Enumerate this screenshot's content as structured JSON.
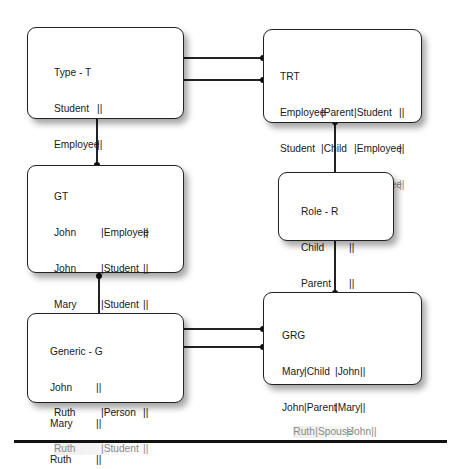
{
  "diagram": {
    "tables": {
      "type_t": {
        "title": "Type - T",
        "rows": [
          {
            "c1": "Student",
            "end": "||"
          },
          {
            "c1": "Employee",
            "end": "||"
          },
          {
            "c1": "Person",
            "end": "||"
          }
        ]
      },
      "trt": {
        "title": "TRT",
        "rows": [
          {
            "c1": "Employee",
            "c2": "|Parent",
            "c3": "|Student",
            "end": "||",
            "faded": false
          },
          {
            "c1": "Student",
            "c2": "|Child",
            "c3": "|Employee",
            "end": "||",
            "faded": false
          },
          {
            "c1": "Student",
            "c2": "|Spouse",
            "c3": "|Employee",
            "end": "||",
            "faded": true
          }
        ]
      },
      "gt": {
        "title": "GT",
        "rows": [
          {
            "c1": "John",
            "c2": "|Employee",
            "end": "||",
            "faded": false
          },
          {
            "c1": "John",
            "c2": "|Student",
            "end": "||",
            "faded": false
          },
          {
            "c1": "Mary",
            "c2": "|Student",
            "end": "||",
            "faded": false
          },
          {
            "c1": "John",
            "c2": "|Person",
            "end": "||",
            "faded": false
          },
          {
            "c1": "Mary",
            "c2": "|Person",
            "end": "||",
            "faded": false
          },
          {
            "c1": "Ruth",
            "c2": "|Person",
            "end": "||",
            "faded": false
          },
          {
            "c1": "Ruth",
            "c2": "|Student",
            "end": "||",
            "faded": true
          }
        ]
      },
      "role_r": {
        "title": "Role - R",
        "rows": [
          {
            "c1": "Child",
            "end": "||",
            "faded": false
          },
          {
            "c1": "Parent",
            "end": "||",
            "faded": false
          },
          {
            "c1": "Spouse",
            "end": "||",
            "faded": true
          }
        ]
      },
      "generic_g": {
        "title": "Generic - G",
        "rows": [
          {
            "c1": "John",
            "end": "||"
          },
          {
            "c1": "Mary",
            "end": "||"
          },
          {
            "c1": "Ruth",
            "end": "||"
          }
        ]
      },
      "grg": {
        "title": "GRG",
        "rows": [
          {
            "c1": "Mary",
            "c2": "|Child",
            "c3": "|John",
            "end": "||",
            "faded": false
          },
          {
            "c1": "John",
            "c2": "|Parent",
            "c3": "|Mary",
            "end": "||",
            "faded": false
          },
          {
            "c1": "Ruth",
            "c2": "|Spouse",
            "c3": "|John",
            "end": "||",
            "faded": true
          }
        ]
      }
    },
    "connections": [
      {
        "from": "Type - T",
        "to": "TRT",
        "count": 2
      },
      {
        "from": "Type - T",
        "to": "GT",
        "count": 1
      },
      {
        "from": "TRT",
        "to": "Role - R",
        "count": 1
      },
      {
        "from": "GT",
        "to": "Generic - G",
        "count": 1
      },
      {
        "from": "Role - R",
        "to": "GRG",
        "count": 1
      },
      {
        "from": "Generic - G",
        "to": "GRG",
        "count": 2
      }
    ],
    "colors": {
      "line": "#222222",
      "faded_text": "#8a8a8a",
      "border": "#222222"
    }
  }
}
